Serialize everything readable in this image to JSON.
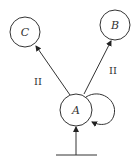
{
  "diagram": {
    "type": "state-diagram",
    "nodes": [
      {
        "id": "A",
        "label": "A"
      },
      {
        "id": "B",
        "label": "B"
      },
      {
        "id": "C",
        "label": "C"
      }
    ],
    "edges": [
      {
        "from": "A",
        "to": "C",
        "label": "II"
      },
      {
        "from": "A",
        "to": "B",
        "label": "II"
      },
      {
        "from": "A",
        "to": "A",
        "label": ""
      },
      {
        "from": "base",
        "to": "A",
        "label": ""
      }
    ]
  }
}
